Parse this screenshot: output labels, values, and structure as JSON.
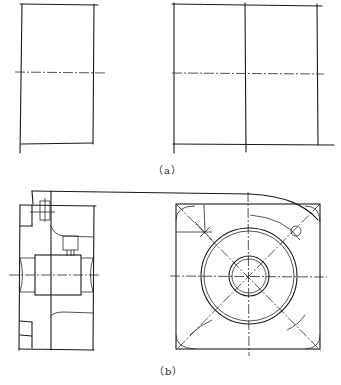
{
  "figure": {
    "part_a": {
      "caption": "（a）",
      "description": "Two framed views with center lines: left narrow rectangle, right square divided into four quadrants"
    },
    "part_b": {
      "caption": "（b）",
      "description": "Sectioned side view of a housing with shaft/bore and flange, plus a front view with concentric circles, diagonal center lines and corner holes"
    }
  },
  "colors": {
    "ink": "#1a1a1a",
    "paper": "#ffffff"
  }
}
